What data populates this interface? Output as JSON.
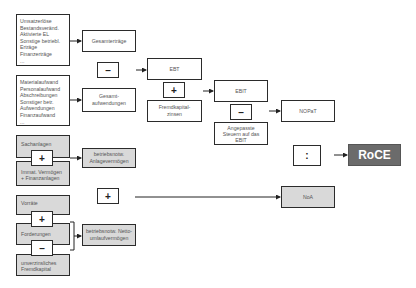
{
  "revenue_items": [
    "Umsatzerlöse",
    "Bestandsveränd.",
    "Aktivierte EL",
    "Sonstige betriebl.",
    "Erträge",
    "Finanzerträge",
    "..."
  ],
  "expense_items": [
    "Materialaufwand",
    "Personalaufwand",
    "Abschreibungen",
    "Sonstiger betr.",
    "Aufwendungen",
    "Finanzaufwand",
    "..."
  ],
  "nodes": {
    "gesamtertraege": "Gesamterträge",
    "gesamtaufwendungen_1": "Gesamt-",
    "gesamtaufwendungen_2": "aufwendungen",
    "ebt": "EBT",
    "fk_zinsen_1": "Fremdkapital-",
    "fk_zinsen_2": "zinsen",
    "ebit": "EBIT",
    "steuern_1": "Angepasste",
    "steuern_2": "Steuern auf das",
    "steuern_3": "EBIT",
    "nopat": "NOPaT",
    "sachanlagen": "Sachanlagen",
    "immat_1": "Immat. Vermögen",
    "immat_2": "+ Finanzanlagen",
    "anlage_1": "betriebsnotw.",
    "anlage_2": "Anlagevermögen",
    "vorraete": "Vorräte",
    "forderungen": "Forderungen",
    "unverz_1": "unverzinsliches",
    "unverz_2": "Fremdkapital",
    "netto_1": "betriebsnotw. Netto-",
    "netto_2": "umlaufvermögen",
    "noa": "NoA",
    "roce": "RoCE"
  },
  "operators": {
    "minus_ebt": "–",
    "plus_fk": "+",
    "minus_tax": "–",
    "divide": ":",
    "plus_anlage": "+",
    "plus_noa": "+",
    "plus_ford": "+",
    "minus_unverz": "–"
  },
  "colors": {
    "roce_fill": "#6b6b6b",
    "gray_fill": "#d9d9d9",
    "border": "#2b2b2b"
  }
}
